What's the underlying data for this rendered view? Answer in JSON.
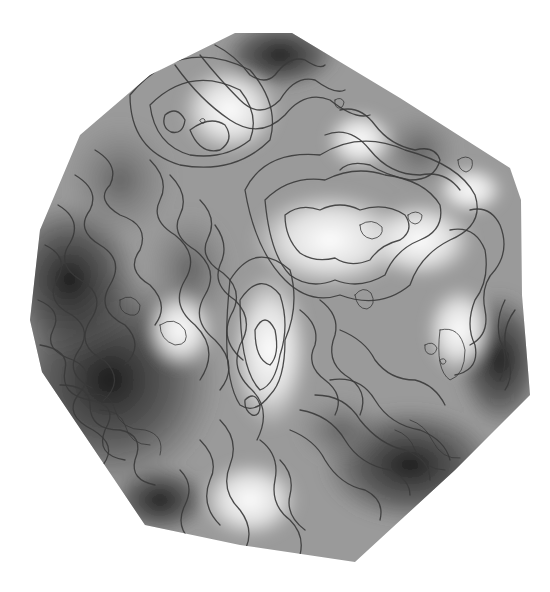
{
  "map": {
    "type": "grayscale-contour-elevation-map",
    "background": "#ffffff",
    "contour_color": "#3a3a3a",
    "shade_dark": "#1a1a1a",
    "shade_light": "#f4f4f4",
    "boundary_polygon": [
      [
        235,
        33
      ],
      [
        292,
        33
      ],
      [
        400,
        98
      ],
      [
        510,
        168
      ],
      [
        521,
        200
      ],
      [
        522,
        295
      ],
      [
        530,
        395
      ],
      [
        455,
        470
      ],
      [
        355,
        562
      ],
      [
        240,
        545
      ],
      [
        145,
        525
      ],
      [
        42,
        372
      ],
      [
        30,
        320
      ],
      [
        40,
        230
      ],
      [
        80,
        135
      ],
      [
        150,
        75
      ]
    ]
  }
}
